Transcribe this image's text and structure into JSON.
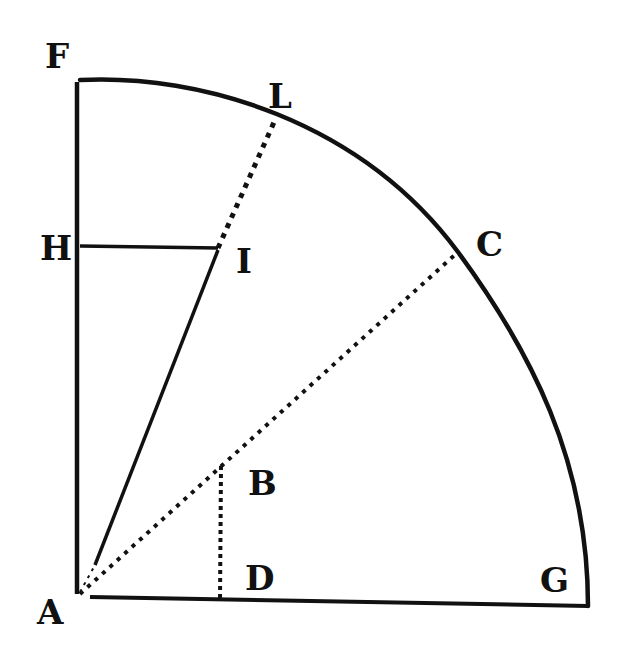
{
  "diagram": {
    "title": "",
    "type": "geometric quadrant construction",
    "colors": {
      "ink": "#111111",
      "paper": "#ffffff"
    },
    "points": [
      {
        "id": "F",
        "label": "F",
        "x": 77,
        "y": 82
      },
      {
        "id": "L",
        "label": "L",
        "x": 275,
        "y": 120
      },
      {
        "id": "H",
        "label": "H",
        "x": 77,
        "y": 247
      },
      {
        "id": "I",
        "label": "I",
        "x": 218,
        "y": 248
      },
      {
        "id": "C",
        "label": "C",
        "x": 458,
        "y": 252
      },
      {
        "id": "B",
        "label": "B",
        "x": 222,
        "y": 463
      },
      {
        "id": "A",
        "label": "A",
        "x": 77,
        "y": 596
      },
      {
        "id": "D",
        "label": "D",
        "x": 219,
        "y": 600
      },
      {
        "id": "G",
        "label": "G",
        "x": 588,
        "y": 606
      }
    ],
    "labels": {
      "F": "F",
      "L": "L",
      "H": "H",
      "I": "I",
      "C": "C",
      "B": "B",
      "A": "A",
      "D": "D",
      "G": "G"
    },
    "segments": [
      {
        "from": "A",
        "to": "F",
        "style": "solid"
      },
      {
        "from": "A",
        "to": "G",
        "style": "solid"
      },
      {
        "from": "H",
        "to": "I",
        "style": "solid"
      },
      {
        "from": "A",
        "to": "I",
        "style": "solid"
      },
      {
        "from": "I",
        "to": "L",
        "style": "dotted"
      },
      {
        "from": "A",
        "to": "C",
        "style": "dotted"
      },
      {
        "from": "B",
        "to": "D",
        "style": "dotted"
      }
    ],
    "arcs": [
      {
        "from": "F",
        "to": "G",
        "center": "A",
        "through": [
          "L",
          "C"
        ],
        "style": "solid"
      }
    ]
  }
}
